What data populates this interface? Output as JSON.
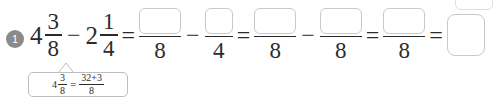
{
  "problem": {
    "number": "1",
    "expression": {
      "term1": {
        "whole": "4",
        "numerator": "3",
        "denominator": "8"
      },
      "operator1": "−",
      "term2": {
        "whole": "2",
        "numerator": "1",
        "denominator": "4"
      },
      "equals1": "=",
      "blank1": {
        "numerator_value": "",
        "denominator": "8",
        "placeholder": ""
      },
      "operator2": "−",
      "blank2": {
        "numerator_value": "",
        "denominator": "4",
        "placeholder": ""
      },
      "equals2": "=",
      "blank3": {
        "numerator_value": "",
        "denominator": "8",
        "placeholder": ""
      },
      "operator3": "−",
      "blank4": {
        "numerator_value": "",
        "denominator": "8",
        "placeholder": ""
      },
      "equals3": "=",
      "blank5": {
        "numerator_value": "",
        "denominator": "8",
        "placeholder": ""
      },
      "equals4": "=",
      "final_answer": {
        "value": "",
        "placeholder": ""
      }
    }
  },
  "hint": {
    "whole": "4",
    "numerator": "3",
    "denominator": "8",
    "equals": "=",
    "result_numerator": "32+3",
    "result_denominator": "8"
  },
  "colors": {
    "bullet_background": "#8a8a8a",
    "bullet_text": "#ffffff",
    "text": "#2b2b2b",
    "box_border": "#c9c9c9",
    "callout_border": "#bdbdbd",
    "page_background": "#ffffff"
  }
}
